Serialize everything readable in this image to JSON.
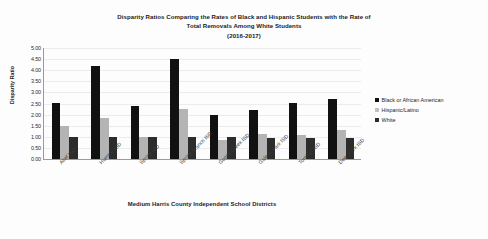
{
  "chart_data": {
    "type": "bar",
    "title": "Disparity Ratios Comparing the Rates of Black and Hispanic Students with the Rate of Total Removals Among White Students (2016-2017)",
    "title_lines": [
      "Disparity Ratios Comparing the Rates of Black and Hispanic Students with the Rate of",
      "Total Removals Among White Students",
      "(2016-2017)"
    ],
    "xlabel": "Medium Harris County Independent School Districts",
    "ylabel": "Disparity Ratio",
    "ylim": [
      0,
      5
    ],
    "ytick_step": 0.5,
    "ytick_labels": [
      "5.00",
      "4.50",
      "4.00",
      "3.50",
      "3.00",
      "2.50",
      "2.00",
      "1.50",
      "1.00",
      "0.50",
      "0.00"
    ],
    "ytick_values": [
      5.0,
      4.5,
      4.0,
      3.5,
      3.0,
      2.5,
      2.0,
      1.5,
      1.0,
      0.5,
      0.0
    ],
    "grid": true,
    "legend_position": "right",
    "categories": [
      "Alief ISD",
      "Humble ISD",
      "Spring ISD",
      "Spring Branch ISD",
      "Goose Creek ISD",
      "Galena Park ISD",
      "Tomball ISD",
      "Deer Park ISD"
    ],
    "series": [
      {
        "name": "Black or African American",
        "color": "#111111",
        "values": [
          2.5,
          4.17,
          2.36,
          4.47,
          1.95,
          2.2,
          2.49,
          2.7
        ]
      },
      {
        "name": "Hispanic/Latino",
        "color": "#b4b4b4",
        "values": [
          1.48,
          1.82,
          1.0,
          2.23,
          0.86,
          1.1,
          1.06,
          1.28
        ]
      },
      {
        "name": "White",
        "color": "#2c2c2c",
        "values": [
          1.0,
          1.0,
          1.0,
          0.98,
          0.97,
          0.96,
          0.95,
          0.94
        ]
      }
    ]
  }
}
